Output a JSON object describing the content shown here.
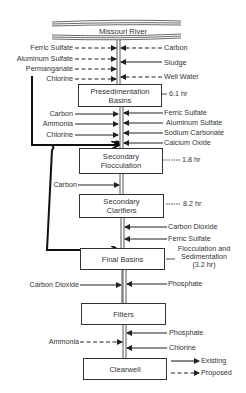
{
  "diagram": {
    "source": "Missouri River",
    "processes": [
      {
        "name": "Presedimentation Basins",
        "time": "6.1 hr"
      },
      {
        "name": "Secondary Flocculation",
        "time": "1.8 hr"
      },
      {
        "name": "Secondary Clarifiers",
        "time": "8.2 hr"
      },
      {
        "name": "Final Basins",
        "time": "Flocculation and Sedimentation (3.2 hr)"
      },
      {
        "name": "Filters",
        "time": ""
      },
      {
        "name": "Clearwell",
        "time": ""
      }
    ],
    "labels": {
      "river": "Missouri River",
      "ferric_sulfate_1": "Ferric Sulfate",
      "aluminum_sulfate_1": "Aluminum Sulfate",
      "permanganate": "Permanganate",
      "chlorine_1": "Chlorine",
      "carbon_r1": "Carbon",
      "sludge": "Sludge",
      "well_water": "Well Water",
      "box1_l1": "Presedimentation",
      "box1_l2": "Basins",
      "time1": "6.1 hr",
      "carbon_2": "Carbon",
      "ammonia_1": "Ammonia",
      "chlorine_2": "Chlorine",
      "ferric_sulfate_2": "Ferric Sulfate",
      "aluminum_sulfate_2": "Aluminum Sulfate",
      "sodium_carbonate": "Sodium Carbonate",
      "calcium_oxide": "Calcium Oxide",
      "box2_l1": "Secondary",
      "box2_l2": "Flocculation",
      "time2": "1.8 hr",
      "carbon_3": "Carbon",
      "box3_l1": "Secondary",
      "box3_l2": "Clarifiers",
      "time3": "8.2 hr",
      "carbon_dioxide_1": "Carbon Dioxide",
      "ferric_sulfate_3": "Ferric Sulfate",
      "box4": "Final Basins",
      "time4_l1": "Flocculation and",
      "time4_l2": "Sedimentation",
      "time4_l3": "(3.2 hr)",
      "carbon_dioxide_2": "Carbon Dioxide",
      "phosphate_1": "Phosphate",
      "box5": "Filters",
      "phosphate_2": "Phosphate",
      "ammonia_2": "Ammonia",
      "chlorine_3": "Chlorine",
      "box6": "Clearwell"
    },
    "legend": {
      "existing": "Existing",
      "proposed": "Proposed"
    }
  }
}
